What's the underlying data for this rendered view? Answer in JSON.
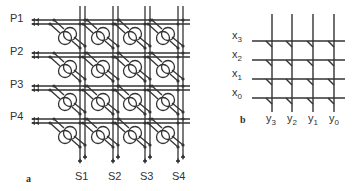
{
  "panel_a": {
    "label": "a",
    "row_labels": [
      "P1",
      "P2",
      "P3",
      "P4"
    ],
    "col_labels": [
      "S1",
      "S2",
      "S3",
      "S4"
    ],
    "grid": {
      "rows": 4,
      "cols": 4,
      "cell": "looped-element with diagonal connectors"
    }
  },
  "panel_b": {
    "label": "b",
    "row_labels": [
      {
        "base": "x",
        "sub": "3"
      },
      {
        "base": "x",
        "sub": "2"
      },
      {
        "base": "x",
        "sub": "1"
      },
      {
        "base": "x",
        "sub": "0"
      }
    ],
    "col_labels": [
      {
        "base": "y",
        "sub": "3"
      },
      {
        "base": "y",
        "sub": "2"
      },
      {
        "base": "y",
        "sub": "1"
      },
      {
        "base": "y",
        "sub": "0"
      }
    ],
    "grid": {
      "rows": 4,
      "cols": 4,
      "cell": "crosspoint tick"
    }
  },
  "colors": {
    "line": "#333333",
    "background": "#ffffff"
  }
}
